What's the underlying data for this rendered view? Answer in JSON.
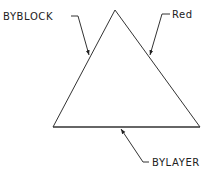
{
  "diagram": {
    "shape": "triangle",
    "stroke_color": "#333333",
    "background": "#ffffff",
    "callouts": [
      {
        "id": "byblock",
        "label": "BYBLOCK",
        "target": "left-edge"
      },
      {
        "id": "red",
        "label": "Red",
        "target": "right-edge"
      },
      {
        "id": "bylayer",
        "label": "BYLAYER",
        "target": "base-edge"
      }
    ]
  }
}
